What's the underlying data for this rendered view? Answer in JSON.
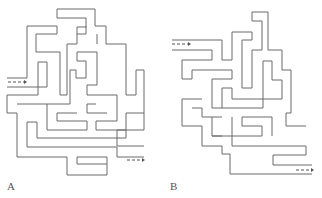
{
  "figure": {
    "panels": [
      {
        "label": "A",
        "entry_arrow": "left",
        "exit_arrow": "right-bottom"
      },
      {
        "label": "B",
        "entry_arrow": "left-top",
        "exit_arrow": "right-bottom"
      }
    ]
  },
  "colors": {
    "line": "#6a6a6a",
    "background": "#ffffff"
  }
}
